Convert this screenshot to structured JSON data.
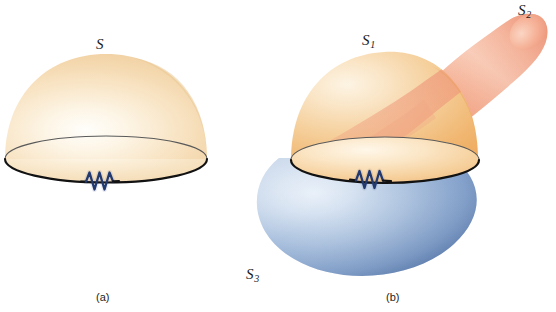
{
  "figure": {
    "background_color": "#ffffff",
    "panels": [
      {
        "id": "a",
        "caption": "(a)",
        "surfaces": [
          {
            "name": "S",
            "label": "S",
            "subscript": "",
            "kind": "hemispherical-dome",
            "fill_light": "#fffdf7",
            "fill_mid": "#f7e0bb",
            "fill_edge": "#f0cf9c"
          }
        ],
        "elements": [
          {
            "name": "boundary-loop",
            "kind": "ellipse-outline",
            "stroke": "#1a1a1a"
          },
          {
            "name": "resistor",
            "kind": "zigzag",
            "stroke": "#223a70"
          }
        ]
      },
      {
        "id": "b",
        "caption": "(b)",
        "surfaces": [
          {
            "name": "S1",
            "label": "S",
            "subscript": "1",
            "kind": "hemispherical-dome",
            "fill_light": "#fdf3e1",
            "fill_mid": "#f4c98d",
            "fill_edge": "#efa95e"
          },
          {
            "name": "S2",
            "label": "S",
            "subscript": "2",
            "kind": "finger-tube",
            "fill_light": "#fbded0",
            "fill_mid": "#f4a487",
            "fill_edge": "#e9886c"
          },
          {
            "name": "S3",
            "label": "S",
            "subscript": "3",
            "kind": "lower-bowl",
            "fill_light": "#dde7f4",
            "fill_mid": "#8fa9ce",
            "fill_edge": "#3f6299"
          }
        ],
        "elements": [
          {
            "name": "boundary-loop",
            "kind": "ellipse-outline",
            "stroke": "#1a1a1a"
          },
          {
            "name": "resistor",
            "kind": "zigzag",
            "stroke": "#223a70"
          }
        ]
      }
    ]
  },
  "labels": {
    "s": {
      "base": "S",
      "sub": ""
    },
    "s1": {
      "base": "S",
      "sub": "1"
    },
    "s2": {
      "base": "S",
      "sub": "2"
    },
    "s3": {
      "base": "S",
      "sub": "3"
    }
  },
  "captions": {
    "a": "(a)",
    "b": "(b)"
  },
  "colors": {
    "background": "#ffffff",
    "outline": "#1a1a1a",
    "resistor": "#223a70",
    "cream_highlight": "#fffdf7",
    "cream_mid": "#f7e0bb",
    "cream_edge": "#f0cf9c",
    "orange_mid": "#f4c98d",
    "orange_edge": "#efa95e",
    "salmon_light": "#fbded0",
    "salmon_mid": "#f4a487",
    "salmon_edge": "#e9886c",
    "blue_light": "#dde7f4",
    "blue_mid": "#8fa9ce",
    "blue_dark": "#3f6299",
    "label_text": "#1a1a1a",
    "caption_text": "#232323"
  }
}
